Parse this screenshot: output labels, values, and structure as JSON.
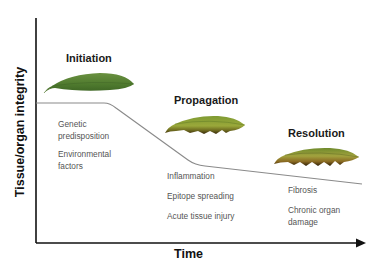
{
  "axes": {
    "y_label": "Tissue/organ integrity",
    "x_label": "Time"
  },
  "phases": [
    {
      "title": "Initiation",
      "factors": [
        "Genetic",
        "predisposition",
        "Environmental",
        "factors"
      ],
      "leaf_state": "healthy-green"
    },
    {
      "title": "Propagation",
      "factors": [
        "Inflammation",
        "Epitope spreading",
        "Acute tissue injury"
      ],
      "leaf_state": "partially-damaged"
    },
    {
      "title": "Resolution",
      "factors": [
        "Fibrosis",
        "Chronic organ",
        "damage"
      ],
      "leaf_state": "heavily-damaged"
    }
  ],
  "colors": {
    "axis": "#111111",
    "curve": "#8a8a8a",
    "leaf_healthy": "#4f7a2e",
    "leaf_mid": "#7b9a2c",
    "leaf_damaged_edge": "#5a3d12"
  }
}
